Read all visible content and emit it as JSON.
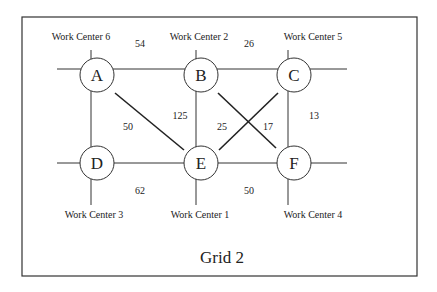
{
  "diagram": {
    "title": "Grid 2",
    "nodes": [
      {
        "id": "A",
        "label": "A",
        "work_center": "Work Center 6"
      },
      {
        "id": "B",
        "label": "B",
        "work_center": "Work Center 2"
      },
      {
        "id": "C",
        "label": "C",
        "work_center": "Work Center 5"
      },
      {
        "id": "D",
        "label": "D",
        "work_center": "Work Center 3"
      },
      {
        "id": "E",
        "label": "E",
        "work_center": "Work Center 1"
      },
      {
        "id": "F",
        "label": "F",
        "work_center": "Work Center 4"
      }
    ],
    "edge_labels": {
      "ab": "54",
      "bc": "26",
      "ae": "50",
      "be": "125",
      "ce": "25",
      "bf": "17",
      "cf": "13",
      "de": "62",
      "ef": "50"
    }
  }
}
